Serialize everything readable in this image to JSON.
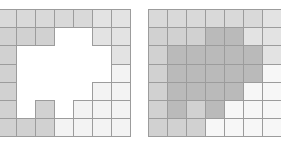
{
  "layout": {
    "col_edges": [
      [
        -3,
        16,
        35,
        54,
        73,
        92,
        111,
        130
      ],
      [
        148,
        167,
        186,
        205,
        224,
        243,
        262,
        284
      ]
    ],
    "row_edges": [
      9,
      27,
      45,
      64,
      82,
      100,
      118,
      136
    ]
  },
  "palette": {
    "E": null,
    "A": "#d9d9d9",
    "B": "#d1d1d1",
    "L": "#e3e3e3",
    "W": "#f3f3f3",
    "D": "#bababa",
    "R": "#f7f7f7"
  },
  "grids": [
    {
      "name": "left-grid",
      "rows": [
        [
          "A",
          "A",
          "A",
          "A",
          "A",
          "L",
          "L"
        ],
        [
          "B",
          "B",
          "B",
          "E",
          "E",
          "L",
          "L"
        ],
        [
          "B",
          "E",
          "E",
          "E",
          "E",
          "E",
          "L"
        ],
        [
          "B",
          "E",
          "E",
          "E",
          "E",
          "E",
          "W"
        ],
        [
          "B",
          "E",
          "E",
          "E",
          "E",
          "W",
          "W"
        ],
        [
          "B",
          "E",
          "B",
          "E",
          "W",
          "W",
          "W"
        ],
        [
          "B",
          "B",
          "B",
          "W",
          "W",
          "W",
          "W"
        ]
      ]
    },
    {
      "name": "right-grid",
      "rows": [
        [
          "A",
          "A",
          "A",
          "A",
          "A",
          "A",
          "L"
        ],
        [
          "B",
          "B",
          "B",
          "D",
          "D",
          "L",
          "L"
        ],
        [
          "B",
          "D",
          "D",
          "D",
          "D",
          "D",
          "L"
        ],
        [
          "B",
          "D",
          "D",
          "D",
          "D",
          "D",
          "R"
        ],
        [
          "B",
          "D",
          "D",
          "D",
          "D",
          "R",
          "R"
        ],
        [
          "B",
          "D",
          "B",
          "D",
          "R",
          "R",
          "R"
        ],
        [
          "B",
          "B",
          "B",
          "R",
          "R",
          "R",
          "R"
        ]
      ]
    }
  ]
}
